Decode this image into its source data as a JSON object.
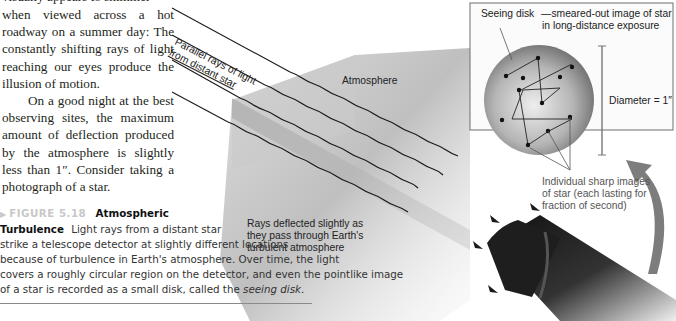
{
  "body_text": {
    "cut_top_line": "visually appears to shimmer",
    "paragraph1_lines": "when viewed across a hot roadway on a summer day: The constantly shifting rays of light reaching our eyes produce the illusion of motion.",
    "paragraph2": "On a good night at the best observing sites, the maximum amount of deflection produced by the atmosphere is slightly less than 1″. Consider taking a photograph of a star."
  },
  "caption": {
    "arrow": "▶",
    "figure_number": "FIGURE 5.18",
    "title": "Atmospheric",
    "title2": "Turbulence",
    "line1": "Light rays from a distant star",
    "line2": "strike a telescope detector at slightly different locations",
    "line3": "because of turbulence in Earth's atmosphere. Over time, the light",
    "line4": "covers a roughly circular region on the detector, and even the pointlike image",
    "line5_pre": "of a star is recorded as a small disk, called the ",
    "line5_em": "seeing disk",
    "line5_post": "."
  },
  "illustration": {
    "label_parallel_rays_1": "Parallel rays of light",
    "label_parallel_rays_2": "from distant star",
    "label_atmosphere": "Atmosphere",
    "label_deflected_1": "Rays deflected slightly as",
    "label_deflected_2": "they pass through Earth's",
    "label_deflected_3": "turbulent atmosphere",
    "inset": {
      "seeing_disk_title": "Seeing disk",
      "seeing_disk_desc_1": "—smeared-out image of star",
      "seeing_disk_desc_2": "in long-distance exposure",
      "diameter_label": "Diameter = 1″"
    },
    "label_individual_1": "Individual sharp images",
    "label_individual_2": "of star (each lasting for",
    "label_individual_3": "fraction of second)"
  }
}
